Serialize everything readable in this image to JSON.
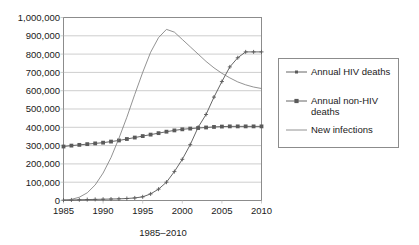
{
  "chart_data": {
    "type": "line",
    "title": "",
    "xlabel": "1985–2010",
    "ylabel": "",
    "xlim": [
      1985,
      2010
    ],
    "ylim": [
      0,
      1000000
    ],
    "grid": true,
    "legend_position": "right",
    "x": [
      1985,
      1986,
      1987,
      1988,
      1989,
      1990,
      1991,
      1992,
      1993,
      1994,
      1995,
      1996,
      1997,
      1998,
      1999,
      2000,
      2001,
      2002,
      2003,
      2004,
      2005,
      2006,
      2007,
      2008,
      2009,
      2010
    ],
    "x_tick_labels": [
      "1985",
      "1990",
      "1995",
      "2000",
      "2005",
      "2010"
    ],
    "x_tick_values": [
      1985,
      1990,
      1995,
      2000,
      2005,
      2010
    ],
    "y_tick_labels": [
      "0",
      "100,000",
      "200,000",
      "300,000",
      "400,000",
      "500,000",
      "600,000",
      "700,000",
      "800,000",
      "900,000",
      "1,000,000"
    ],
    "y_tick_values": [
      0,
      100000,
      200000,
      300000,
      400000,
      500000,
      600000,
      700000,
      800000,
      900000,
      1000000
    ],
    "series": [
      {
        "name": "Annual HIV deaths",
        "marker": "cross",
        "values": [
          2000,
          3000,
          4000,
          5000,
          6000,
          7000,
          8000,
          9000,
          11000,
          14000,
          20000,
          36000,
          62000,
          100000,
          158000,
          225000,
          305000,
          400000,
          470000,
          565000,
          650000,
          730000,
          780000,
          812000,
          812000,
          812000
        ]
      },
      {
        "name": "Annual non-HIV deaths",
        "marker": "square",
        "values": [
          295000,
          300000,
          304000,
          308000,
          312000,
          316000,
          322000,
          328000,
          336000,
          344000,
          352000,
          360000,
          368000,
          376000,
          383000,
          389000,
          393000,
          396000,
          399000,
          402000,
          404000,
          405000,
          405000,
          405000,
          405000,
          405000
        ]
      },
      {
        "name": "New infections",
        "marker": "none",
        "values": [
          2000,
          6000,
          18000,
          42000,
          85000,
          150000,
          235000,
          340000,
          455000,
          580000,
          700000,
          810000,
          890000,
          935000,
          920000,
          880000,
          840000,
          800000,
          760000,
          725000,
          695000,
          670000,
          648000,
          632000,
          620000,
          612000
        ]
      }
    ]
  },
  "legend": {
    "items": [
      {
        "label": "Annual HIV deaths",
        "marker": "cross"
      },
      {
        "label": "Annual non-HIV deaths",
        "marker": "square"
      },
      {
        "label": "New infections",
        "marker": "none"
      }
    ]
  }
}
